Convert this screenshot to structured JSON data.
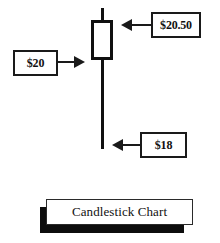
{
  "figure": {
    "title": "Candlestick Chart",
    "background_color": "#ffffff",
    "ink_color": "#101010"
  },
  "callouts": [
    {
      "id": "high",
      "label": "$20.50",
      "arrow": "arrow-left-icon",
      "points_to": "candle-body-top"
    },
    {
      "id": "open",
      "label": "$20",
      "arrow": "arrow-right-icon",
      "points_to": "candle-body-bottom"
    },
    {
      "id": "low",
      "label": "$18",
      "arrow": "arrow-left-icon",
      "points_to": "lower-wick-bottom"
    }
  ],
  "chart_data": {
    "type": "candlestick",
    "title": "Candlestick Chart",
    "xlabel": "",
    "ylabel": "",
    "categories": [
      "1"
    ],
    "series": [
      {
        "name": "price",
        "open": 20.5,
        "high": 20.5,
        "low": 18,
        "close": 20,
        "body_filled": false
      }
    ],
    "annotations": [
      {
        "text": "$20.50",
        "value": 20.5,
        "target": "body top / high",
        "arrow_direction": "left"
      },
      {
        "text": "$20",
        "value": 20,
        "target": "body bottom",
        "arrow_direction": "right"
      },
      {
        "text": "$18",
        "value": 18,
        "target": "low wick end",
        "arrow_direction": "left"
      }
    ],
    "ylim": [
      18,
      20.5
    ],
    "grid": false,
    "legend": false
  }
}
